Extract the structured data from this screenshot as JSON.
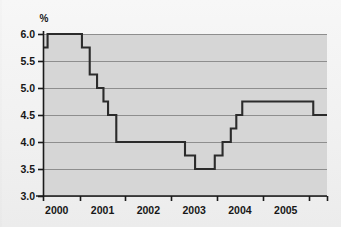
{
  "chart_data": {
    "type": "line",
    "title": "",
    "subtitle": "",
    "xlabel": "",
    "ylabel": "%",
    "ylim": [
      3.0,
      6.0
    ],
    "xlim": [
      1999.7,
      2005.9
    ],
    "grid": true,
    "legend": null,
    "step": "post",
    "y_ticks": [
      3.0,
      3.5,
      4.0,
      4.5,
      5.0,
      5.5,
      6.0
    ],
    "y_tick_labels": [
      "3.0",
      "3.5",
      "4.0",
      "4.5",
      "5.0",
      "5.5",
      "6.0"
    ],
    "x_ticks": [
      1999.7,
      2000.5,
      2001.5,
      2002.5,
      2003.5,
      2004.5,
      2005.5,
      2005.9
    ],
    "x_tick_labels": [
      "2000",
      "2001",
      "2002",
      "2003",
      "2004",
      "2005"
    ],
    "x_tick_label_positions": [
      2000.0,
      2001.0,
      2002.0,
      2003.0,
      2004.0,
      2005.0
    ],
    "series": [
      {
        "name": "Policy interest rate",
        "color": "#2b2b2b",
        "x": [
          1999.7,
          1999.8,
          2000.55,
          2000.72,
          2000.88,
          2001.02,
          2001.12,
          2001.3,
          2002.55,
          2002.8,
          2003.02,
          2003.45,
          2003.62,
          2003.8,
          2003.92,
          2004.05,
          2004.18,
          2005.6,
          2005.9
        ],
        "values": [
          5.75,
          6.0,
          5.75,
          5.25,
          5.0,
          4.75,
          4.5,
          4.0,
          4.0,
          3.75,
          3.5,
          3.75,
          4.0,
          4.25,
          4.5,
          4.75,
          4.75,
          4.5,
          4.5
        ]
      }
    ],
    "annotations": []
  },
  "colors": {
    "plot_background": "#d6d6d6",
    "gridline": "#8e8e8e",
    "axis": "#1a1a1a",
    "line": "#2b2b2b",
    "text": "#171717",
    "figure_background": "#f2f2f2"
  },
  "axis": {
    "y_axis_unit_label": "%"
  }
}
